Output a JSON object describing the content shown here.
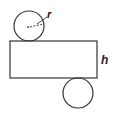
{
  "diagram": {
    "labels": {
      "radius": "r",
      "height": "h"
    },
    "colors": {
      "stroke": "#333333",
      "background": "#ffffff"
    },
    "shapes": {
      "top_circle": {
        "cx": 29,
        "cy": 26,
        "r": 15
      },
      "rectangle": {
        "x": 10,
        "y": 41,
        "width": 87,
        "height": 37
      },
      "bottom_circle": {
        "cx": 78,
        "cy": 93,
        "r": 15
      }
    }
  }
}
